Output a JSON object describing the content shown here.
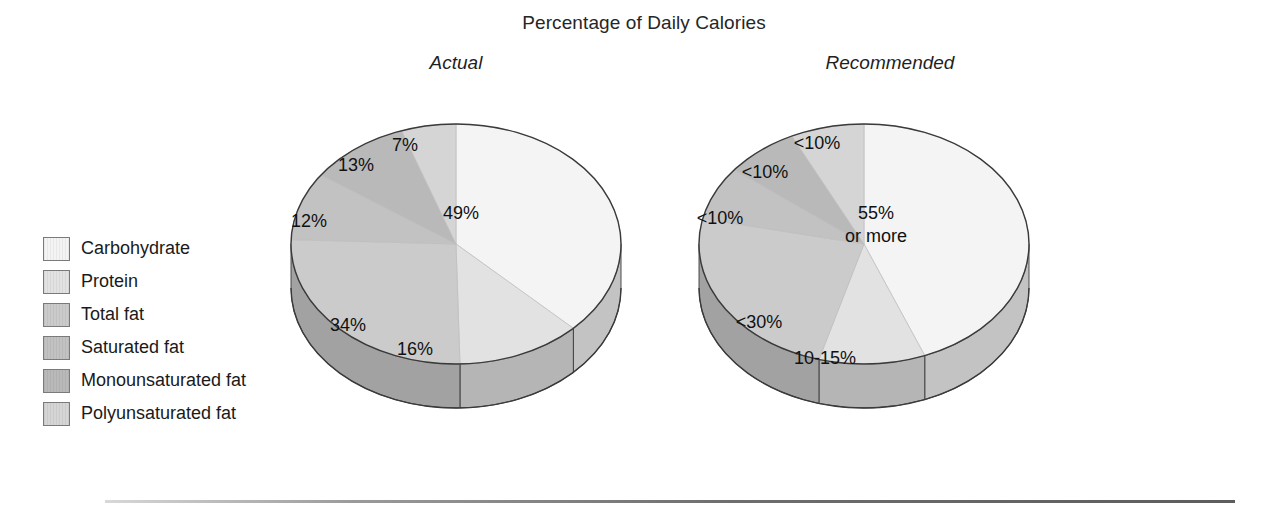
{
  "title": "Percentage of Daily Calories",
  "panels": [
    {
      "id": "actual",
      "title": "Actual"
    },
    {
      "id": "recommended",
      "title": "Recommended"
    }
  ],
  "legend": {
    "items": [
      {
        "label": "Carbohydrate",
        "color": "#f4f4f4"
      },
      {
        "label": "Protein",
        "color": "#e2e2e2"
      },
      {
        "label": "Total fat",
        "color": "#cbcbcb"
      },
      {
        "label": "Saturated fat",
        "color": "#c2c2c2"
      },
      {
        "label": "Monounsaturated fat",
        "color": "#b9b9b9"
      },
      {
        "label": "Polyunsaturated fat",
        "color": "#d5d5d5"
      }
    ]
  },
  "chart_data": [
    {
      "type": "pie",
      "title": "Actual",
      "subtitle": "Percentage of Daily Calories",
      "categories": [
        "Carbohydrate",
        "Protein",
        "Total fat",
        "Saturated fat",
        "Monounsaturated fat",
        "Polyunsaturated fat"
      ],
      "values": [
        49,
        16,
        34,
        12,
        13,
        7
      ],
      "labels": [
        "49%",
        "16%",
        "34%",
        "12%",
        "13%",
        "7%"
      ],
      "colors": [
        "#f4f4f4",
        "#e2e2e2",
        "#cbcbcb",
        "#c2c2c2",
        "#b9b9b9",
        "#d5d5d5"
      ],
      "start_angle_deg": 0,
      "direction": "clockwise",
      "three_d": true,
      "legend_position": "left"
    },
    {
      "type": "pie",
      "title": "Recommended",
      "subtitle": "Percentage of Daily Calories",
      "categories": [
        "Carbohydrate",
        "Protein",
        "Total fat",
        "Saturated fat",
        "Monounsaturated fat",
        "Polyunsaturated fat"
      ],
      "values": [
        55,
        13,
        30,
        9,
        9,
        9
      ],
      "labels": [
        "55% or more",
        "10-15%",
        "<30%",
        "<10%",
        "<10%",
        "<10%"
      ],
      "colors": [
        "#f4f4f4",
        "#e2e2e2",
        "#cbcbcb",
        "#c2c2c2",
        "#b9b9b9",
        "#d5d5d5"
      ],
      "start_angle_deg": 0,
      "direction": "clockwise",
      "three_d": true,
      "legend_position": "left"
    }
  ],
  "pies": {
    "actual": {
      "slices": [
        {
          "name": "carbohydrate",
          "value": 49,
          "label": "49%",
          "color": "#f4f4f4",
          "lx": 175,
          "ly": 127
        },
        {
          "name": "protein",
          "value": 16,
          "label": "16%",
          "color": "#e2e2e2",
          "lx": 129,
          "ly": 263
        },
        {
          "name": "total-fat",
          "value": 34,
          "label": "34%",
          "color": "#cbcbcb",
          "lx": 62,
          "ly": 239
        },
        {
          "name": "saturated-fat",
          "value": 12,
          "label": "12%",
          "color": "#c2c2c2",
          "lx": 23,
          "ly": 135
        },
        {
          "name": "monounsaturated-fat",
          "value": 13,
          "label": "13%",
          "color": "#b9b9b9",
          "lx": 70,
          "ly": 79
        },
        {
          "name": "polyunsaturated-fat",
          "value": 7,
          "label": "7%",
          "color": "#d5d5d5",
          "lx": 119,
          "ly": 59
        }
      ]
    },
    "recommended": {
      "slices": [
        {
          "name": "carbohydrate",
          "value": 55,
          "label": "55%",
          "label2": "or more",
          "color": "#f4f4f4",
          "lx": 182,
          "ly": 127
        },
        {
          "name": "protein",
          "value": 13,
          "label": "10-15%",
          "color": "#e2e2e2",
          "lx": 131,
          "ly": 272
        },
        {
          "name": "total-fat",
          "value": 30,
          "label": "<30%",
          "color": "#cbcbcb",
          "lx": 65,
          "ly": 236
        },
        {
          "name": "saturated-fat",
          "value": 9,
          "label": "<10%",
          "color": "#c2c2c2",
          "lx": 26,
          "ly": 132
        },
        {
          "name": "monounsaturated-fat",
          "value": 9,
          "label": "<10%",
          "color": "#b9b9b9",
          "lx": 71,
          "ly": 86
        },
        {
          "name": "polyunsaturated-fat",
          "value": 9,
          "label": "<10%",
          "color": "#d5d5d5",
          "lx": 123,
          "ly": 57
        }
      ]
    }
  }
}
